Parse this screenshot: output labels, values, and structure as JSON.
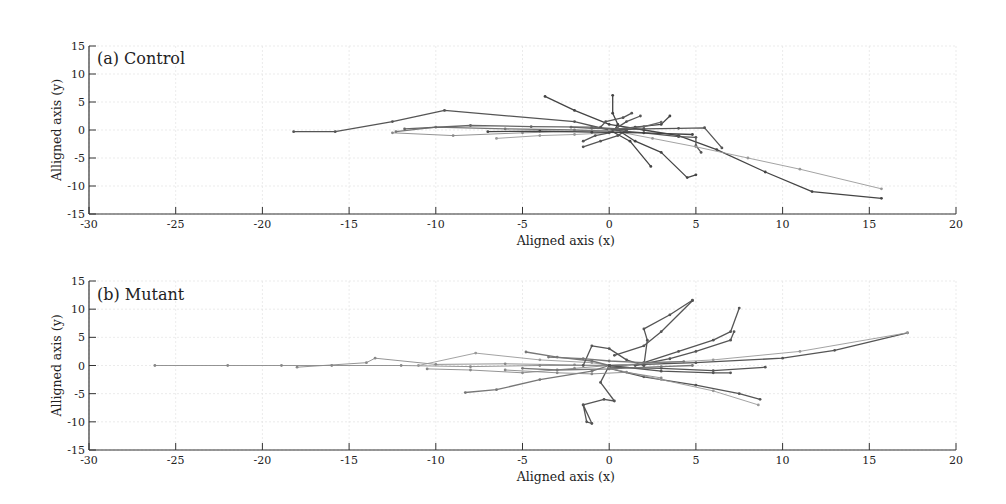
{
  "chart_data": [
    {
      "type": "line",
      "title": "(a) Control",
      "xlabel": "Aligned axis (x)",
      "ylabel": "Alligned axis (y)",
      "xlim": [
        -30,
        20
      ],
      "ylim": [
        -15,
        15
      ],
      "xticks": [
        -30,
        -25,
        -20,
        -15,
        -10,
        -5,
        0,
        5,
        10,
        15,
        20
      ],
      "yticks": [
        15,
        10,
        5,
        0,
        -5,
        -10,
        -15
      ],
      "grid": true,
      "legend": null,
      "series": [
        {
          "name": "track-1",
          "color": "#555555",
          "points": [
            [
              -18.2,
              -0.3
            ],
            [
              -15.8,
              -0.3
            ],
            [
              -12.5,
              1.5
            ],
            [
              -9.5,
              3.5
            ],
            [
              -2,
              1.5
            ],
            [
              0,
              0
            ]
          ]
        },
        {
          "name": "track-2",
          "color": "#444444",
          "points": [
            [
              -3.7,
              6
            ],
            [
              -2,
              3.5
            ],
            [
              0,
              1
            ],
            [
              2,
              0
            ],
            [
              4,
              -1
            ],
            [
              6.2,
              -3.5
            ],
            [
              9,
              -7.5
            ],
            [
              11.7,
              -11
            ],
            [
              15.7,
              -12.2
            ]
          ]
        },
        {
          "name": "track-3",
          "color": "#777777",
          "points": [
            [
              -12.3,
              -0.3
            ],
            [
              -10,
              0.5
            ],
            [
              -6,
              0.2
            ],
            [
              -2,
              0
            ],
            [
              0,
              -0.2
            ]
          ]
        },
        {
          "name": "track-4",
          "color": "#888888",
          "points": [
            [
              -12.5,
              -0.5
            ],
            [
              -9,
              -1
            ],
            [
              -5,
              -0.5
            ],
            [
              -1,
              -0.2
            ],
            [
              1,
              0
            ]
          ]
        },
        {
          "name": "track-5",
          "color": "#666666",
          "points": [
            [
              -11.8,
              0.2
            ],
            [
              -8,
              0.8
            ],
            [
              -4.5,
              0.6
            ],
            [
              -1,
              0.5
            ],
            [
              0.5,
              0.2
            ]
          ]
        },
        {
          "name": "track-6",
          "color": "#999999",
          "points": [
            [
              -6.5,
              -1.5
            ],
            [
              -4,
              -1
            ],
            [
              -2,
              -0.8
            ],
            [
              0,
              -0.5
            ]
          ]
        },
        {
          "name": "track-7",
          "color": "#444444",
          "points": [
            [
              0.2,
              6.2
            ],
            [
              0.2,
              3
            ],
            [
              0.5,
              1
            ],
            [
              0.3,
              0
            ]
          ]
        },
        {
          "name": "track-8",
          "color": "#444444",
          "points": [
            [
              0.5,
              0
            ],
            [
              1.5,
              -2
            ],
            [
              3,
              -4
            ],
            [
              4.5,
              -8.5
            ],
            [
              5,
              -8
            ]
          ]
        },
        {
          "name": "track-9",
          "color": "#444444",
          "points": [
            [
              0.2,
              -0.3
            ],
            [
              1.2,
              -2
            ],
            [
              2.4,
              -6.5
            ]
          ]
        },
        {
          "name": "track-10",
          "color": "#555555",
          "points": [
            [
              -1.5,
              -3
            ],
            [
              -0.5,
              -2
            ],
            [
              0.5,
              -1
            ],
            [
              1,
              0
            ]
          ]
        },
        {
          "name": "track-11",
          "color": "#444444",
          "points": [
            [
              0,
              0
            ],
            [
              1.5,
              0.5
            ],
            [
              3,
              1
            ],
            [
              3.5,
              2.5
            ]
          ]
        },
        {
          "name": "track-12",
          "color": "#555555",
          "points": [
            [
              0,
              0
            ],
            [
              2,
              -0.5
            ],
            [
              4,
              -1.2
            ],
            [
              5,
              -1.3
            ],
            [
              5,
              -2.8
            ],
            [
              5.3,
              -4
            ]
          ]
        },
        {
          "name": "track-13",
          "color": "#555555",
          "points": [
            [
              0,
              0
            ],
            [
              2,
              0.2
            ],
            [
              4,
              0.3
            ],
            [
              5.5,
              0.4
            ],
            [
              6.5,
              -3.2
            ]
          ]
        },
        {
          "name": "track-14",
          "color": "#999999",
          "points": [
            [
              0,
              0
            ],
            [
              2.5,
              -1.5
            ],
            [
              5,
              -3
            ],
            [
              8,
              -5
            ],
            [
              11,
              -7
            ],
            [
              15.7,
              -10.5
            ]
          ]
        },
        {
          "name": "track-15",
          "color": "#555555",
          "points": [
            [
              -0.5,
              0.5
            ],
            [
              -0.2,
              1.5
            ],
            [
              0.8,
              2.2
            ],
            [
              1.3,
              3
            ]
          ]
        },
        {
          "name": "track-16",
          "color": "#555555",
          "points": [
            [
              -1.5,
              -2
            ],
            [
              -0.8,
              -1
            ],
            [
              0,
              -0.5
            ],
            [
              1,
              1.5
            ],
            [
              1.8,
              2.5
            ]
          ]
        },
        {
          "name": "track-17",
          "color": "#666666",
          "points": [
            [
              -2.2,
              0.5
            ],
            [
              -1,
              0.3
            ],
            [
              0.5,
              0.2
            ],
            [
              2,
              0.6
            ],
            [
              3,
              1.4
            ]
          ]
        },
        {
          "name": "track-18",
          "color": "#444444",
          "points": [
            [
              -7,
              -0.3
            ],
            [
              -4,
              -0.2
            ],
            [
              -1,
              -0.4
            ],
            [
              2,
              -0.5
            ],
            [
              4.8,
              -0.8
            ]
          ]
        }
      ]
    },
    {
      "type": "line",
      "title": "(b) Mutant",
      "xlabel": "Aligned axis (x)",
      "ylabel": "Alligned axis (y)",
      "xlim": [
        -30,
        20
      ],
      "ylim": [
        -15,
        15
      ],
      "xticks": [
        -30,
        -25,
        -20,
        -15,
        -10,
        -5,
        0,
        5,
        10,
        15,
        20
      ],
      "yticks": [
        15,
        10,
        5,
        0,
        -5,
        -10,
        -15
      ],
      "grid": true,
      "legend": null,
      "series": [
        {
          "name": "track-1",
          "color": "#888888",
          "points": [
            [
              -26.2,
              0
            ],
            [
              -22,
              0
            ],
            [
              -18.9,
              0
            ],
            [
              -16,
              0
            ],
            [
              -12,
              0
            ],
            [
              -8,
              -0.2
            ],
            [
              -4,
              0
            ],
            [
              0,
              0
            ]
          ]
        },
        {
          "name": "track-2",
          "color": "#888888",
          "points": [
            [
              -18,
              -0.3
            ],
            [
              -14,
              0.5
            ],
            [
              -13.5,
              1.3
            ],
            [
              -10,
              0.2
            ],
            [
              -6,
              0.3
            ],
            [
              -2,
              0.1
            ],
            [
              0,
              0
            ]
          ]
        },
        {
          "name": "track-3",
          "color": "#999999",
          "points": [
            [
              -11,
              0
            ],
            [
              -7.7,
              2.2
            ],
            [
              -4,
              1
            ],
            [
              -1,
              0.5
            ],
            [
              0,
              0
            ]
          ]
        },
        {
          "name": "track-4",
          "color": "#888888",
          "points": [
            [
              -10.5,
              -0.6
            ],
            [
              -8,
              -0.8
            ],
            [
              -5,
              -1.3
            ],
            [
              -2,
              -0.5
            ],
            [
              0,
              0
            ]
          ]
        },
        {
          "name": "track-5",
          "color": "#777777",
          "points": [
            [
              -8.3,
              -4.8
            ],
            [
              -6.5,
              -4.3
            ],
            [
              -4,
              -2.5
            ],
            [
              -1,
              -1
            ],
            [
              0,
              0
            ]
          ]
        },
        {
          "name": "track-6",
          "color": "#777777",
          "points": [
            [
              -4.8,
              2.4
            ],
            [
              -3,
              1.5
            ],
            [
              -1,
              0.8
            ],
            [
              0,
              0
            ]
          ]
        },
        {
          "name": "track-7",
          "color": "#555555",
          "points": [
            [
              -1.5,
              -7
            ],
            [
              -1.3,
              -10
            ],
            [
              -1,
              -10.3
            ],
            [
              -1.5,
              -7
            ],
            [
              -0.3,
              -6
            ],
            [
              0.3,
              -6.3
            ],
            [
              -0.5,
              -3
            ],
            [
              0,
              0
            ]
          ]
        },
        {
          "name": "track-8",
          "color": "#555555",
          "points": [
            [
              -1.5,
              0
            ],
            [
              -1,
              3.5
            ],
            [
              0,
              3
            ],
            [
              1,
              1
            ],
            [
              2,
              0
            ]
          ]
        },
        {
          "name": "track-9",
          "color": "#555555",
          "points": [
            [
              0.3,
              1.8
            ],
            [
              2,
              3.5
            ],
            [
              3,
              6
            ],
            [
              4.8,
              11.5
            ]
          ]
        },
        {
          "name": "track-10",
          "color": "#555555",
          "points": [
            [
              2,
              0
            ],
            [
              2.2,
              4.5
            ],
            [
              2,
              6.5
            ],
            [
              3.5,
              9
            ],
            [
              4.8,
              11.6
            ]
          ]
        },
        {
          "name": "track-11",
          "color": "#555555",
          "points": [
            [
              2,
              0.5
            ],
            [
              4,
              2.5
            ],
            [
              6,
              4.5
            ],
            [
              7,
              6
            ],
            [
              7.5,
              10.2
            ]
          ]
        },
        {
          "name": "track-12",
          "color": "#555555",
          "points": [
            [
              1.5,
              0
            ],
            [
              3.5,
              1.2
            ],
            [
              5,
              2.5
            ],
            [
              7,
              4.5
            ],
            [
              7.2,
              6
            ]
          ]
        },
        {
          "name": "track-13",
          "color": "#555555",
          "points": [
            [
              0,
              0
            ],
            [
              5,
              0.5
            ],
            [
              10,
              1.3
            ],
            [
              13,
              2.7
            ],
            [
              17.2,
              5.8
            ]
          ]
        },
        {
          "name": "track-14",
          "color": "#999999",
          "points": [
            [
              0,
              0
            ],
            [
              6,
              1
            ],
            [
              11,
              2.5
            ],
            [
              17.2,
              5.8
            ]
          ]
        },
        {
          "name": "track-15",
          "color": "#555555",
          "points": [
            [
              0,
              -0.3
            ],
            [
              3,
              -0.5
            ],
            [
              6,
              -0.9
            ],
            [
              9,
              -0.3
            ]
          ]
        },
        {
          "name": "track-16",
          "color": "#555555",
          "points": [
            [
              0,
              0
            ],
            [
              3,
              -1
            ],
            [
              6,
              -1.3
            ],
            [
              7,
              -1.3
            ]
          ]
        },
        {
          "name": "track-17",
          "color": "#555555",
          "points": [
            [
              0,
              -0.5
            ],
            [
              2,
              -2
            ],
            [
              5,
              -3.5
            ],
            [
              7.5,
              -5
            ],
            [
              8.7,
              -6
            ]
          ]
        },
        {
          "name": "track-18",
          "color": "#999999",
          "points": [
            [
              0,
              -0.5
            ],
            [
              3,
              -2.5
            ],
            [
              6,
              -4.5
            ],
            [
              8.6,
              -7
            ]
          ]
        },
        {
          "name": "track-19",
          "color": "#777777",
          "points": [
            [
              -5,
              -0.5
            ],
            [
              -3,
              -0.8
            ],
            [
              0,
              -0.6
            ],
            [
              3,
              -0.2
            ],
            [
              4.8,
              0
            ]
          ]
        },
        {
          "name": "track-20",
          "color": "#777777",
          "points": [
            [
              -3.5,
              1.5
            ],
            [
              -1.5,
              1.2
            ],
            [
              0,
              0.8
            ],
            [
              2,
              0.5
            ],
            [
              4.3,
              0.7
            ]
          ]
        },
        {
          "name": "track-21",
          "color": "#888888",
          "points": [
            [
              -6,
              -0.8
            ],
            [
              -3,
              -1.3
            ],
            [
              -1,
              -1.5
            ],
            [
              1,
              -1.2
            ],
            [
              3,
              -2.2
            ]
          ]
        }
      ]
    }
  ]
}
